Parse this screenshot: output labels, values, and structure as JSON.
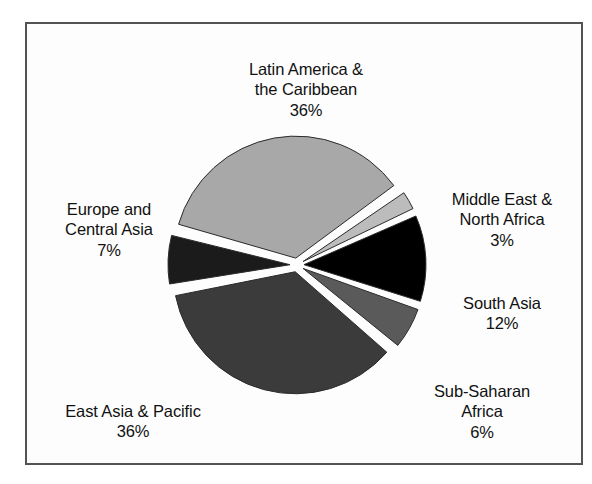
{
  "figure": {
    "background": "#ffffff",
    "frame_color": "#535353",
    "label_color": "#111111"
  },
  "chart_data": {
    "type": "pie",
    "title": "",
    "subtitle": "",
    "xlabel": "",
    "ylabel": "",
    "legend_position": "outside-labels",
    "grid": false,
    "total": 100,
    "units": "percent",
    "start_angle_deg": -75,
    "direction": "clockwise",
    "exploded": true,
    "categories": [
      "Latin America & the Caribbean",
      "Middle East & North Africa",
      "South Asia",
      "Sub-Saharan Africa",
      "East Asia & Pacific",
      "Europe and Central Asia"
    ],
    "values": [
      36,
      3,
      12,
      6,
      36,
      7
    ],
    "labels": [
      "36%",
      "3%",
      "12%",
      "6%",
      "36%",
      "7%"
    ],
    "colors": [
      "#a8a8a8",
      "#bcbcbc",
      "#000000",
      "#5a5a5a",
      "#3b3b3b",
      "#1b1b1b"
    ],
    "slices": [
      {
        "name": "Latin America & the Caribbean",
        "value": 36,
        "label": "36%",
        "color": "#a8a8a8",
        "start_deg": -75,
        "end_deg": 54.6
      },
      {
        "name": "Middle East & North Africa",
        "value": 3,
        "label": "3%",
        "color": "#bcbcbc",
        "start_deg": 54.6,
        "end_deg": 65.4
      },
      {
        "name": "South Asia",
        "value": 12,
        "label": "12%",
        "color": "#000000",
        "start_deg": 65.4,
        "end_deg": 108.6
      },
      {
        "name": "Sub-Saharan Africa",
        "value": 6,
        "label": "6%",
        "color": "#5a5a5a",
        "start_deg": 108.6,
        "end_deg": 130.2
      },
      {
        "name": "East Asia & Pacific",
        "value": 36,
        "label": "36%",
        "color": "#3b3b3b",
        "start_deg": 130.2,
        "end_deg": 259.8
      },
      {
        "name": "Europe and Central Asia",
        "value": 7,
        "label": "7%",
        "color": "#1b1b1b",
        "start_deg": 259.8,
        "end_deg": 285
      }
    ]
  },
  "labels": {
    "latin_america": {
      "name": "Latin America &\nthe Caribbean",
      "percent": "36%"
    },
    "middle_east": {
      "name": "Middle East &\nNorth Africa",
      "percent": "3%"
    },
    "south_asia": {
      "name": "South Asia",
      "percent": "12%"
    },
    "sub_saharan": {
      "name": "Sub-Saharan\nAfrica",
      "percent": "6%"
    },
    "east_asia": {
      "name": "East Asia & Pacific",
      "percent": "36%"
    },
    "europe_central_asia": {
      "name": "Europe and\nCentral Asia",
      "percent": "7%"
    }
  }
}
